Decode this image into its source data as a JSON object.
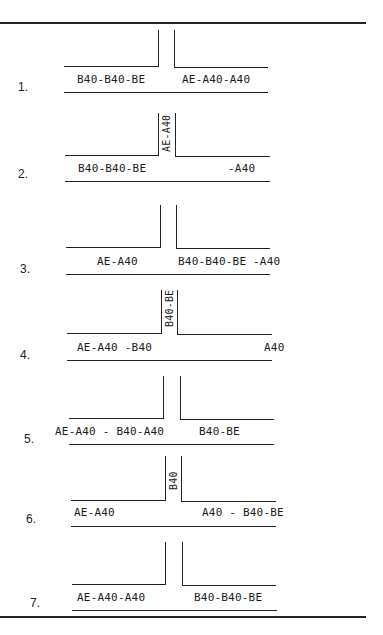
{
  "diagrams": [
    {
      "number": "1.",
      "left_label": "B40-B40-BE",
      "right_label": "AE-A40-A40",
      "stem_label": ""
    },
    {
      "number": "2.",
      "left_label": "B40-B40-BE",
      "right_label": "-A40",
      "stem_label": "AE-A40"
    },
    {
      "number": "3.",
      "left_label": "AE-A40",
      "right_label": "B40-B40-BE -A40",
      "stem_label": ""
    },
    {
      "number": "4.",
      "left_label": "AE-A40 -B40",
      "right_label": "A40",
      "stem_label": "B40-BE"
    },
    {
      "number": "5.",
      "left_label": "AE-A40 - B40-A40",
      "right_label": "B40-BE",
      "stem_label": ""
    },
    {
      "number": "6.",
      "left_label": "AE-A40",
      "right_label": "A40 - B40-BE",
      "stem_label": "B40"
    },
    {
      "number": "7.",
      "left_label": "AE-A40-A40",
      "right_label": "B40-B40-BE",
      "stem_label": ""
    }
  ]
}
